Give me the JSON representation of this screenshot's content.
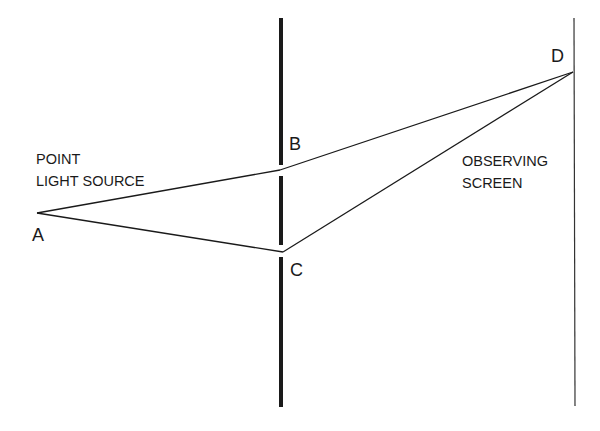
{
  "diagram": {
    "points": {
      "A": {
        "label": "A",
        "x": 37,
        "y": 213
      },
      "B": {
        "label": "B",
        "x": 280,
        "y": 170
      },
      "C": {
        "label": "C",
        "x": 283,
        "y": 252
      },
      "D": {
        "label": "D",
        "x": 573,
        "y": 72
      }
    },
    "labels": {
      "source_line1": "POINT",
      "source_line2": "LIGHT SOURCE",
      "screen_line1": "OBSERVING",
      "screen_line2": "SCREEN"
    },
    "colors": {
      "ink": "#1a1a1a",
      "background": "#ffffff"
    }
  }
}
